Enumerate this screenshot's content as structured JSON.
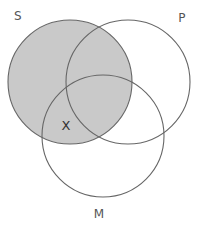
{
  "diagram": {
    "type": "venn-3-circle",
    "title": "",
    "background_color": "#ffffff",
    "stroke_color": "#666666",
    "stroke_width": 1.1,
    "shade_color": "#c9c9c9",
    "label_color": "#555555",
    "mark_color": "#333333",
    "canvas": {
      "width": 205,
      "height": 227
    },
    "circles": [
      {
        "id": "S",
        "label": "S",
        "cx": 70,
        "cy": 82,
        "r": 62,
        "filled": true,
        "fill": "#c9c9c9",
        "label_x": 18,
        "label_y": 20
      },
      {
        "id": "P",
        "label": "P",
        "cx": 128,
        "cy": 82,
        "r": 62,
        "filled": false,
        "fill": "none",
        "label_x": 182,
        "label_y": 22
      },
      {
        "id": "M",
        "label": "M",
        "cx": 103,
        "cy": 136,
        "r": 61,
        "filled": false,
        "fill": "none",
        "label_x": 99,
        "label_y": 218
      }
    ],
    "regions": [
      {
        "id": "S-only",
        "name": "S only",
        "shaded": true
      },
      {
        "id": "S-and-P",
        "name": "S and P",
        "shaded": true
      },
      {
        "id": "S-and-M",
        "name": "S and M",
        "shaded": true
      },
      {
        "id": "S-and-P-and-M",
        "name": "S and P and M",
        "shaded": true
      },
      {
        "id": "P-only",
        "name": "P only",
        "shaded": false
      },
      {
        "id": "M-only",
        "name": "M only",
        "shaded": false
      },
      {
        "id": "P-and-M",
        "name": "P and M",
        "shaded": false
      }
    ],
    "marks": [
      {
        "id": "x-mark",
        "symbol": "X",
        "x": 66,
        "y": 130,
        "region": "S-and-M"
      }
    ]
  }
}
